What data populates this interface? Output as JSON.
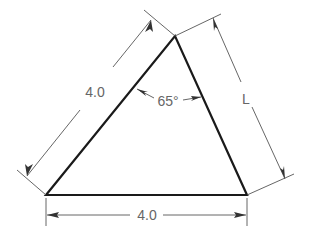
{
  "diagram": {
    "type": "triangle-dimension-drawing",
    "labels": {
      "left_side": "4.0",
      "bottom_side": "4.0",
      "right_side": "L",
      "apex_angle": "65°"
    },
    "colors": {
      "object_line": "#1a1a1a",
      "dimension_line": "#555555",
      "text": "#666666",
      "background": "#ffffff"
    }
  }
}
